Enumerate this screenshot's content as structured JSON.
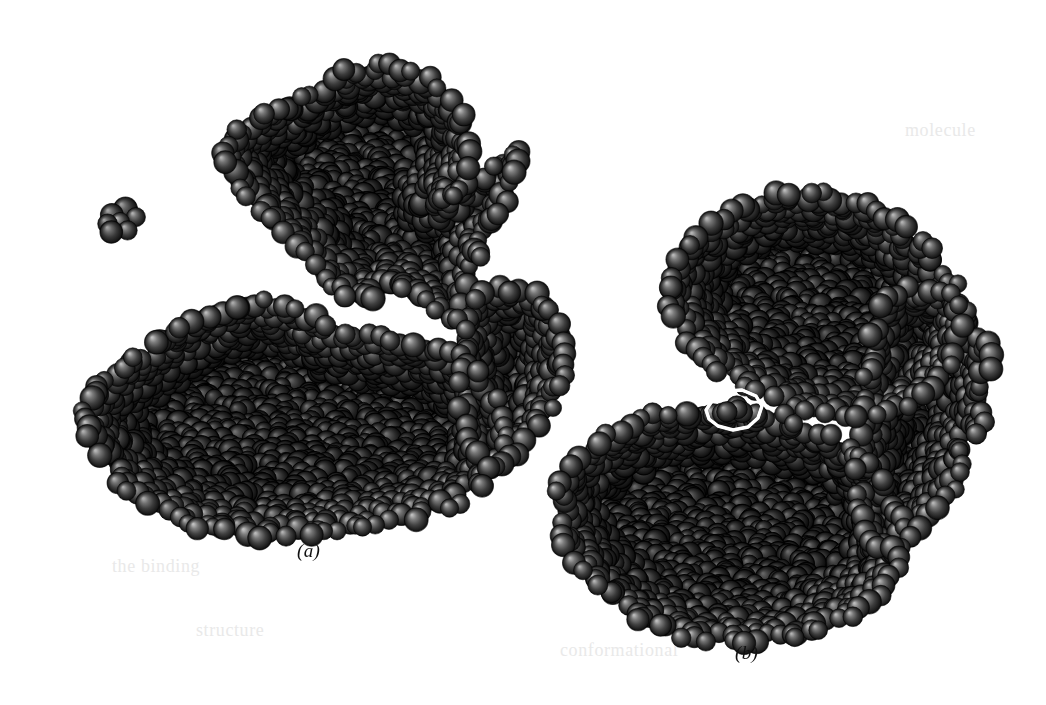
{
  "figure": {
    "width": 1046,
    "height": 705,
    "background_color": "#ffffff",
    "render_style": "space-filling-cpk",
    "atom_color_base": "#3b3b3b",
    "atom_color_highlight": "#8e8e8e",
    "atom_color_shadow": "#050505",
    "atom_outline_color": "#000000",
    "ligand_outline_color": "#ffffff"
  },
  "panels": [
    {
      "id": "a",
      "label": "(a)",
      "label_x": 297,
      "label_y": 540,
      "caption_state": "open",
      "description": "bilobed macromolecule, open cleft conformation",
      "has_ligand_outline": false
    },
    {
      "id": "b",
      "label": "(b)",
      "label_x": 735,
      "label_y": 642,
      "caption_state": "closed",
      "description": "bilobed macromolecule, closed conformation with bound ligand outlined in white",
      "has_ligand_outline": true
    }
  ],
  "bleed_through_text": [
    {
      "text": "the binding",
      "x": 112,
      "y": 556,
      "size": 18
    },
    {
      "text": "protein",
      "x": 838,
      "y": 228,
      "size": 18
    },
    {
      "text": "domain closure",
      "x": 706,
      "y": 256,
      "size": 18
    },
    {
      "text": "conformational",
      "x": 560,
      "y": 640,
      "size": 18
    },
    {
      "text": "structure",
      "x": 196,
      "y": 620,
      "size": 18
    },
    {
      "text": "hinge",
      "x": 918,
      "y": 470,
      "size": 18
    },
    {
      "text": "molecule",
      "x": 905,
      "y": 120,
      "size": 18
    }
  ],
  "shapes": {
    "panel_a": {
      "small_cluster": {
        "cx": 120,
        "cy": 222,
        "r": 30,
        "atoms": 7
      },
      "upper_lobe": [
        [
          300,
          95
        ],
        [
          340,
          75
        ],
        [
          385,
          68
        ],
        [
          425,
          80
        ],
        [
          455,
          105
        ],
        [
          470,
          140
        ],
        [
          462,
          175
        ],
        [
          440,
          205
        ],
        [
          470,
          180
        ],
        [
          500,
          160
        ],
        [
          520,
          150
        ],
        [
          500,
          210
        ],
        [
          478,
          250
        ],
        [
          470,
          290
        ],
        [
          455,
          325
        ],
        [
          430,
          300
        ],
        [
          400,
          285
        ],
        [
          370,
          295
        ],
        [
          345,
          290
        ],
        [
          318,
          268
        ],
        [
          300,
          240
        ],
        [
          268,
          215
        ],
        [
          240,
          185
        ],
        [
          225,
          150
        ],
        [
          250,
          120
        ]
      ],
      "lower_lobe": [
        [
          110,
          380
        ],
        [
          150,
          345
        ],
        [
          200,
          320
        ],
        [
          250,
          300
        ],
        [
          290,
          310
        ],
        [
          330,
          330
        ],
        [
          370,
          340
        ],
        [
          420,
          345
        ],
        [
          460,
          360
        ],
        [
          490,
          395
        ],
        [
          505,
          430
        ],
        [
          495,
          468
        ],
        [
          470,
          495
        ],
        [
          430,
          512
        ],
        [
          380,
          522
        ],
        [
          330,
          530
        ],
        [
          280,
          535
        ],
        [
          230,
          530
        ],
        [
          185,
          520
        ],
        [
          145,
          500
        ],
        [
          110,
          470
        ],
        [
          88,
          430
        ],
        [
          90,
          400
        ]
      ],
      "right_arm": [
        [
          470,
          300
        ],
        [
          505,
          290
        ],
        [
          540,
          300
        ],
        [
          560,
          330
        ],
        [
          562,
          370
        ],
        [
          548,
          410
        ],
        [
          520,
          445
        ],
        [
          492,
          470
        ],
        [
          470,
          440
        ],
        [
          462,
          400
        ],
        [
          466,
          350
        ]
      ]
    },
    "panel_b": {
      "upper_lobe": [
        [
          710,
          230
        ],
        [
          750,
          205
        ],
        [
          795,
          195
        ],
        [
          840,
          200
        ],
        [
          880,
          215
        ],
        [
          915,
          240
        ],
        [
          945,
          270
        ],
        [
          960,
          310
        ],
        [
          955,
          350
        ],
        [
          935,
          385
        ],
        [
          900,
          405
        ],
        [
          860,
          415
        ],
        [
          820,
          412
        ],
        [
          780,
          400
        ],
        [
          742,
          382
        ],
        [
          710,
          360
        ],
        [
          682,
          330
        ],
        [
          668,
          292
        ],
        [
          680,
          255
        ]
      ],
      "lower_lobe": [
        [
          565,
          470
        ],
        [
          605,
          440
        ],
        [
          650,
          420
        ],
        [
          700,
          410
        ],
        [
          750,
          412
        ],
        [
          800,
          425
        ],
        [
          845,
          445
        ],
        [
          880,
          475
        ],
        [
          900,
          512
        ],
        [
          900,
          552
        ],
        [
          880,
          590
        ],
        [
          845,
          618
        ],
        [
          800,
          635
        ],
        [
          750,
          642
        ],
        [
          700,
          638
        ],
        [
          655,
          625
        ],
        [
          615,
          605
        ],
        [
          585,
          575
        ],
        [
          565,
          540
        ],
        [
          558,
          505
        ]
      ],
      "right_arm": [
        [
          880,
          300
        ],
        [
          925,
          290
        ],
        [
          965,
          300
        ],
        [
          985,
          340
        ],
        [
          988,
          390
        ],
        [
          975,
          440
        ],
        [
          950,
          490
        ],
        [
          915,
          530
        ],
        [
          880,
          552
        ],
        [
          860,
          510
        ],
        [
          858,
          460
        ],
        [
          865,
          400
        ],
        [
          872,
          345
        ]
      ],
      "ligand_outline": [
        [
          706,
          410
        ],
        [
          714,
          398
        ],
        [
          726,
          391
        ],
        [
          742,
          390
        ],
        [
          756,
          396
        ],
        [
          762,
          406
        ],
        [
          758,
          418
        ],
        [
          748,
          427
        ],
        [
          733,
          430
        ],
        [
          718,
          426
        ],
        [
          709,
          419
        ]
      ]
    }
  }
}
